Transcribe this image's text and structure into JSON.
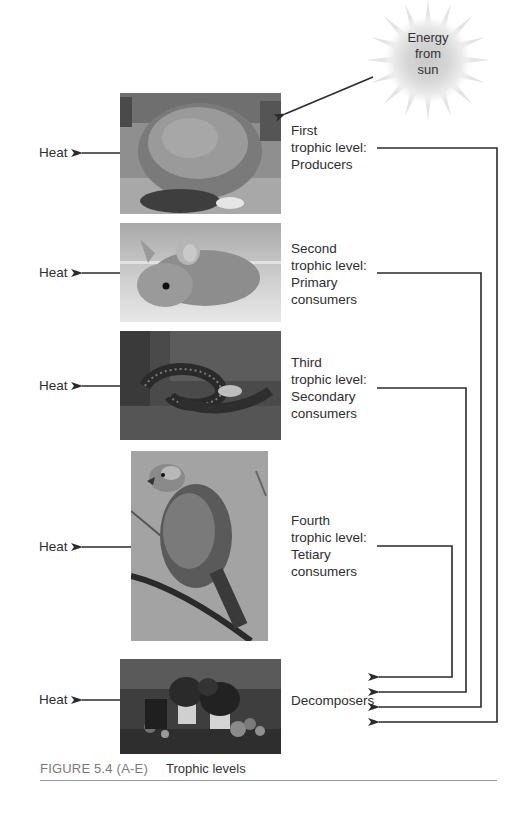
{
  "diagram": {
    "title": "Trophic levels",
    "sun": {
      "label_lines": [
        "Energy",
        "from",
        "sun"
      ]
    },
    "levels": [
      {
        "id": "producers",
        "label_lines": [
          "First",
          "trophic level:",
          "Producers"
        ],
        "image_subject": "shrub",
        "heat_label": "Heat"
      },
      {
        "id": "primary",
        "label_lines": [
          "Second",
          "trophic level:",
          "Primary",
          "consumers"
        ],
        "image_subject": "mouse",
        "heat_label": "Heat"
      },
      {
        "id": "secondary",
        "label_lines": [
          "Third",
          "trophic level:",
          "Secondary",
          "consumers"
        ],
        "image_subject": "snake",
        "heat_label": "Heat"
      },
      {
        "id": "tertiary",
        "label_lines": [
          "Fourth",
          "trophic level:",
          "Tetiary",
          "consumers"
        ],
        "image_subject": "hawk",
        "heat_label": "Heat"
      },
      {
        "id": "decomposers",
        "label_lines": [
          "Decomposers"
        ],
        "image_subject": "mushrooms",
        "heat_label": "Heat"
      }
    ],
    "flows": [
      {
        "from": "sun",
        "to": "producers"
      },
      {
        "from": "producers",
        "to": "decomposers"
      },
      {
        "from": "primary",
        "to": "decomposers"
      },
      {
        "from": "secondary",
        "to": "decomposers"
      },
      {
        "from": "tertiary",
        "to": "decomposers"
      }
    ]
  },
  "caption": {
    "figure_number": "FIGURE 5.4 (A-E)",
    "title": "Trophic levels"
  },
  "colors": {
    "line": "#2a2a2a",
    "caption_gray": "#7a7a7a",
    "rule": "#9a9a9a"
  }
}
